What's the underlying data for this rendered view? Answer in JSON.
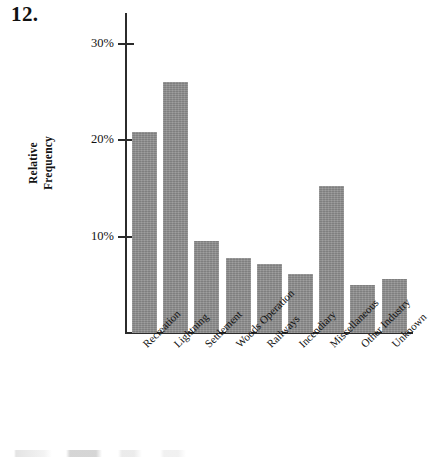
{
  "figure": {
    "problem_number": "12.",
    "ylabel_line1": "Relative",
    "ylabel_line2": "Frequency"
  },
  "chart_data": {
    "type": "bar",
    "title": "",
    "xlabel": "",
    "ylabel": "Relative Frequency",
    "categories": [
      "Recreation",
      "Lightning",
      "Settlement",
      "Woods Operation",
      "Railways",
      "Incendiary",
      "Miscellaneous",
      "Other Industry",
      "Unknown"
    ],
    "values": [
      20.8,
      26.0,
      9.5,
      7.8,
      7.2,
      6.1,
      15.2,
      5.0,
      5.6
    ],
    "value_unit": "%",
    "ylim": [
      0,
      33
    ],
    "yticks": [
      10,
      20,
      30
    ],
    "ytick_labels": [
      "10%",
      "20%",
      "30%"
    ],
    "grid": false,
    "legend": null,
    "bar_color": "#8b8b8b",
    "axis_color": "#2b2b2b"
  }
}
